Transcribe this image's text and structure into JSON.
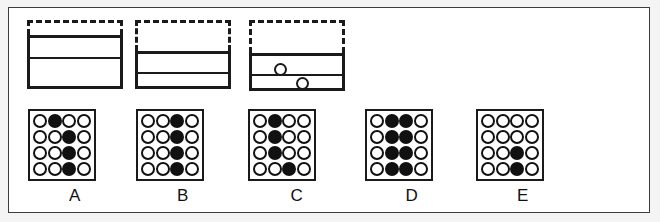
{
  "figure": {
    "background_color": "#f4f4f4",
    "frame_color": "#3c3c3c",
    "ink_color": "#1a1a1a",
    "panel_color": "#ffffff"
  },
  "columns": [
    {
      "id": "A",
      "label": "A",
      "left": 18,
      "apparatus": {
        "present": true,
        "dashed": {
          "top": 12,
          "height": 15
        },
        "solid": {
          "top": 27,
          "height": 54
        },
        "dividers": [
          19
        ],
        "bubbles": []
      },
      "grid": {
        "left": 19,
        "top": 101,
        "width": 68,
        "height": 72,
        "rows": 4,
        "cols": 4,
        "cells": [
          [
            0,
            1,
            0,
            0
          ],
          [
            0,
            0,
            1,
            0
          ],
          [
            0,
            0,
            1,
            0
          ],
          [
            0,
            0,
            1,
            0
          ]
        ]
      },
      "label_top": 178
    },
    {
      "id": "B",
      "label": "B",
      "left": 126,
      "apparatus": {
        "present": true,
        "dashed": {
          "top": 12,
          "height": 31
        },
        "solid": {
          "top": 43,
          "height": 38
        },
        "dividers": [
          18
        ],
        "bubbles": []
      },
      "grid": {
        "left": 127,
        "top": 101,
        "width": 68,
        "height": 72,
        "rows": 4,
        "cols": 4,
        "cells": [
          [
            0,
            0,
            1,
            0
          ],
          [
            0,
            0,
            1,
            0
          ],
          [
            0,
            0,
            1,
            0
          ],
          [
            0,
            0,
            1,
            0
          ]
        ]
      },
      "label_top": 178
    },
    {
      "id": "C",
      "label": "C",
      "left": 240,
      "apparatus": {
        "present": true,
        "dashed": {
          "top": 12,
          "height": 33
        },
        "solid": {
          "top": 45,
          "height": 38
        },
        "dividers": [
          18
        ],
        "bubbles": [
          {
            "left": 22,
            "top": 7
          },
          {
            "left": 44,
            "top": 21
          }
        ]
      },
      "grid": {
        "left": 239,
        "top": 101,
        "width": 68,
        "height": 72,
        "rows": 4,
        "cols": 4,
        "cells": [
          [
            0,
            1,
            0,
            0
          ],
          [
            0,
            1,
            0,
            0
          ],
          [
            0,
            1,
            0,
            0
          ],
          [
            0,
            0,
            1,
            0
          ]
        ]
      },
      "label_top": 178
    },
    {
      "id": "D",
      "label": "D",
      "left": 355,
      "apparatus": {
        "present": false,
        "dashed": null,
        "solid": null,
        "dividers": [],
        "bubbles": []
      },
      "grid": {
        "left": 356,
        "top": 101,
        "width": 68,
        "height": 72,
        "rows": 4,
        "cols": 4,
        "cells": [
          [
            0,
            1,
            1,
            0
          ],
          [
            0,
            1,
            1,
            0
          ],
          [
            0,
            1,
            1,
            0
          ],
          [
            0,
            1,
            1,
            0
          ]
        ]
      },
      "label_top": 178
    },
    {
      "id": "E",
      "label": "E",
      "left": 466,
      "apparatus": {
        "present": false,
        "dashed": null,
        "solid": null,
        "dividers": [],
        "bubbles": []
      },
      "grid": {
        "left": 467,
        "top": 101,
        "width": 68,
        "height": 72,
        "rows": 4,
        "cols": 4,
        "cells": [
          [
            0,
            0,
            0,
            0
          ],
          [
            0,
            0,
            0,
            0
          ],
          [
            0,
            0,
            1,
            0
          ],
          [
            0,
            0,
            1,
            0
          ]
        ]
      },
      "label_top": 178
    }
  ]
}
